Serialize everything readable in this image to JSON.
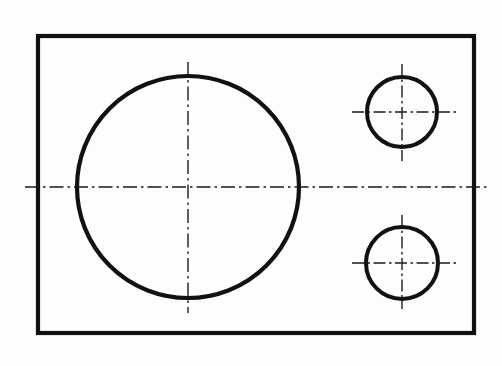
{
  "drawing": {
    "title": "Orthographic front view of a rectangular plate with three through holes",
    "type": "engineering-drawing",
    "canvas": {
      "width": 502,
      "height": 366
    },
    "background_color": "#fdfdfc",
    "line_color": "#111111",
    "centerline_color": "#1a1a1a",
    "outline_stroke_width": 4.2,
    "circle_stroke_width": 4.0,
    "centerline_stroke_width": 1.4,
    "centerline_dash_pattern": "14,4,2.5,4",
    "plate": {
      "name": "rectangular plate outline",
      "x": 38,
      "y": 36,
      "width": 436,
      "height": 297,
      "stroke_width": 4.2
    },
    "holes": [
      {
        "name": "large-center-hole",
        "label": "large hole",
        "cx": 188,
        "cy": 187,
        "r": 111,
        "stroke_width": 4.2,
        "centerline_h": {
          "x1": 25,
          "x2": 487,
          "y": 187
        },
        "centerline_v": {
          "y1": 62,
          "y2": 313,
          "x": 188
        }
      },
      {
        "name": "upper-right-hole",
        "label": "small upper hole",
        "cx": 402,
        "cy": 112,
        "r": 35,
        "stroke_width": 4.0,
        "centerline_h": {
          "x1": 352,
          "x2": 457,
          "y": 112
        },
        "centerline_v": {
          "y1": 64,
          "y2": 161,
          "x": 402
        }
      },
      {
        "name": "lower-right-hole",
        "label": "small lower hole",
        "cx": 402,
        "cy": 263,
        "r": 36,
        "stroke_width": 4.0,
        "centerline_h": {
          "x1": 352,
          "x2": 459,
          "y": 263
        },
        "centerline_v": {
          "y1": 215,
          "y2": 309,
          "x": 402
        }
      }
    ]
  }
}
